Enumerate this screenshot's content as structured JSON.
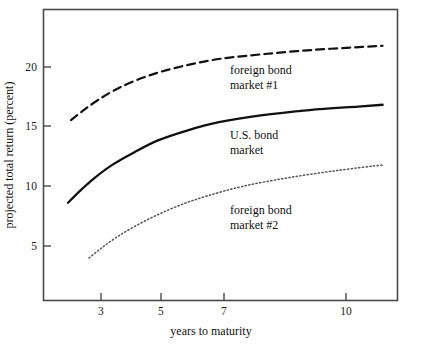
{
  "chart_data": {
    "type": "line",
    "title": "",
    "xlabel": "years to maturity",
    "ylabel": "projected total return (percent)",
    "grid": false,
    "legend_position": "inline-annotations",
    "xlim": [
      1.55,
      11.1
    ],
    "ylim": [
      0.6,
      24.5
    ],
    "xticks": [
      3,
      5,
      7,
      10
    ],
    "xtick_labels": [
      "3",
      "5",
      "7",
      "10"
    ],
    "yticks": [
      5,
      10,
      15,
      20
    ],
    "ytick_labels": [
      "5",
      "10",
      "15",
      "20"
    ],
    "series": [
      {
        "name": "foreign bond market #1",
        "style": "dashed",
        "color": "#111111",
        "x": [
          2.0,
          2.4,
          2.9,
          3.5,
          4.2,
          5.0,
          5.9,
          6.9,
          8.0,
          9.2,
          10.4,
          10.9
        ],
        "values": [
          15.5,
          16.3,
          17.2,
          18.1,
          18.9,
          19.6,
          20.2,
          20.7,
          21.1,
          21.45,
          21.7,
          21.8
        ]
      },
      {
        "name": "U.S. bond market",
        "style": "solid",
        "color": "#111111",
        "x": [
          1.9,
          2.3,
          2.8,
          3.4,
          4.1,
          4.9,
          5.8,
          6.8,
          7.9,
          9.1,
          10.3,
          10.9
        ],
        "values": [
          8.6,
          9.6,
          10.7,
          11.8,
          12.8,
          13.8,
          14.6,
          15.3,
          15.9,
          16.35,
          16.65,
          16.8
        ]
      },
      {
        "name": "foreign bond market #2",
        "style": "dotted",
        "color": "#555555",
        "x": [
          2.6,
          3.0,
          3.5,
          4.1,
          4.8,
          5.6,
          6.5,
          7.5,
          8.6,
          9.8,
          10.9
        ],
        "values": [
          4.0,
          4.8,
          5.7,
          6.6,
          7.5,
          8.4,
          9.2,
          10.0,
          10.7,
          11.3,
          11.75
        ]
      }
    ],
    "annotations": [
      {
        "id": "ann-foreign-1",
        "lines": [
          "foreign bond",
          "market #1"
        ],
        "x_px": 230,
        "y_px": 63
      },
      {
        "id": "ann-us",
        "lines": [
          "U.S. bond",
          "market"
        ],
        "x_px": 230,
        "y_px": 128
      },
      {
        "id": "ann-foreign-2",
        "lines": [
          "foreign bond",
          "market #2"
        ],
        "x_px": 230,
        "y_px": 203
      }
    ]
  }
}
